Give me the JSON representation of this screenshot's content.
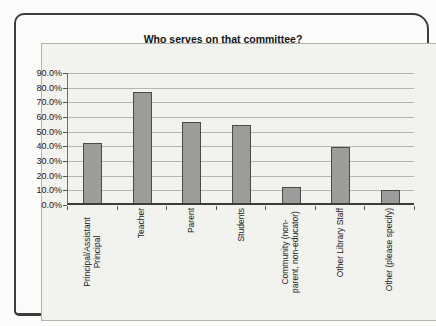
{
  "chart_data": {
    "type": "bar",
    "title": "Who serves on that committee?",
    "categories": [
      "Principal/Assistant Principal",
      "Teacher",
      "Parent",
      "Students",
      "Community (non-parent, non-educator)",
      "Other Library Staff",
      "Other (please specify)"
    ],
    "values": [
      41,
      76,
      55,
      53,
      11,
      38,
      9
    ],
    "value_unit": "percent",
    "y_ticks": [
      "90.0%",
      "80.0%",
      "70.0%",
      "60.0%",
      "50.0%",
      "40.0%",
      "30.0%",
      "20.0%",
      "10.0%",
      "0.0%"
    ],
    "ylim": [
      0,
      90
    ],
    "xlabel": "",
    "ylabel": "",
    "grid": true,
    "legend": false,
    "colors": {
      "bar_fill": "#9c9c9a",
      "bar_border": "#4a4a4a",
      "gridline": "#b5b5b2",
      "chart_background": "#f2f2ee",
      "frame_border": "#3d3d3d",
      "text": "#1a1a1a"
    }
  }
}
